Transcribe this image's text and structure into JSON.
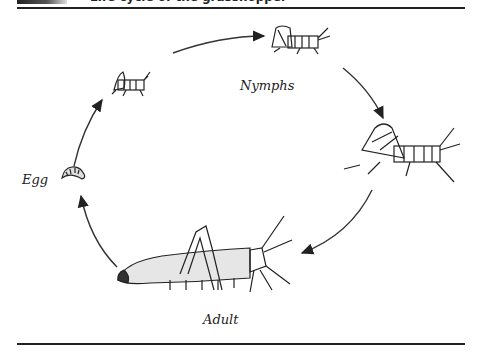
{
  "figure": {
    "title_partial": "Life cycle of the grasshopper",
    "labels": {
      "egg": "Egg",
      "nymphs": "Nymphs",
      "adult": "Adult"
    },
    "stages": [
      "Egg",
      "Nymph (early)",
      "Nymph (middle)",
      "Nymph (late)",
      "Adult"
    ],
    "colors": {
      "ink": "#222222",
      "background": "#ffffff"
    }
  }
}
